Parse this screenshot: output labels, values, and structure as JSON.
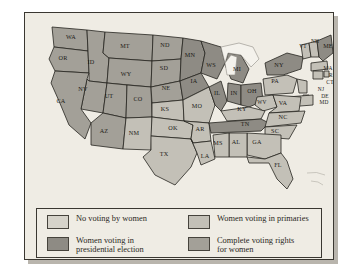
{
  "figure": {
    "colors": {
      "no_voting": "#d6d3ca",
      "primaries": "#c3c0b7",
      "presidential": "#8e8b84",
      "complete": "#a3a098",
      "border": "#26241f",
      "plate_background": "#efece4"
    }
  },
  "legend": {
    "items": [
      {
        "key": "no_voting",
        "swatch_class": "sw-none",
        "label": "No voting by women"
      },
      {
        "key": "presidential",
        "swatch_class": "sw-pres",
        "label": "Women voting in\npresidential election"
      },
      {
        "key": "primaries",
        "swatch_class": "sw-prim",
        "label": "Women voting in primaries"
      },
      {
        "key": "complete",
        "swatch_class": "sw-full",
        "label": "Complete voting rights\nfor women"
      }
    ]
  },
  "map": {
    "states": [
      {
        "abbr": "WA",
        "category": "complete",
        "x": 46,
        "y": 26
      },
      {
        "abbr": "OR",
        "category": "complete",
        "x": 38,
        "y": 47
      },
      {
        "abbr": "ID",
        "category": "complete",
        "x": 66,
        "y": 51
      },
      {
        "abbr": "MT",
        "category": "complete",
        "x": 100,
        "y": 35
      },
      {
        "abbr": "ND",
        "category": "complete",
        "x": 140,
        "y": 34
      },
      {
        "abbr": "MN",
        "category": "presidential",
        "x": 165,
        "y": 44
      },
      {
        "abbr": "WS",
        "category": "presidential",
        "x": 186,
        "y": 54
      },
      {
        "abbr": "SD",
        "category": "complete",
        "x": 139,
        "y": 57
      },
      {
        "abbr": "WY",
        "category": "complete",
        "x": 101,
        "y": 63
      },
      {
        "abbr": "NV",
        "category": "complete",
        "x": 58,
        "y": 78
      },
      {
        "abbr": "CA",
        "category": "complete",
        "x": 36,
        "y": 90
      },
      {
        "abbr": "UT",
        "category": "complete",
        "x": 84,
        "y": 85
      },
      {
        "abbr": "CO",
        "category": "complete",
        "x": 113,
        "y": 88
      },
      {
        "abbr": "NE",
        "category": "complete",
        "x": 141,
        "y": 77
      },
      {
        "abbr": "IA",
        "category": "presidential",
        "x": 169,
        "y": 70
      },
      {
        "abbr": "IL",
        "category": "presidential",
        "x": 192,
        "y": 82
      },
      {
        "abbr": "MI",
        "category": "presidential",
        "x": 212,
        "y": 58
      },
      {
        "abbr": "IN",
        "category": "presidential",
        "x": 209,
        "y": 82
      },
      {
        "abbr": "OH",
        "category": "presidential",
        "x": 227,
        "y": 80
      },
      {
        "abbr": "PA",
        "category": "primaries",
        "x": 250,
        "y": 70
      },
      {
        "abbr": "NY",
        "category": "presidential",
        "x": 254,
        "y": 54
      },
      {
        "abbr": "VT",
        "category": "primaries",
        "x": 278,
        "y": 35
      },
      {
        "abbr": "NH",
        "category": "primaries",
        "x": 290,
        "y": 30
      },
      {
        "abbr": "ME",
        "category": "presidential",
        "x": 303,
        "y": 35
      },
      {
        "abbr": "MA",
        "category": "primaries",
        "x": 303,
        "y": 57
      },
      {
        "abbr": "RI",
        "category": "primaries",
        "x": 307,
        "y": 64
      },
      {
        "abbr": "CT",
        "category": "primaries",
        "x": 305,
        "y": 71
      },
      {
        "abbr": "NJ",
        "category": "primaries",
        "x": 296,
        "y": 78
      },
      {
        "abbr": "DE",
        "category": "primaries",
        "x": 300,
        "y": 85
      },
      {
        "abbr": "MD",
        "category": "primaries",
        "x": 299,
        "y": 91
      },
      {
        "abbr": "WV",
        "category": "primaries",
        "x": 237,
        "y": 91
      },
      {
        "abbr": "VA",
        "category": "primaries",
        "x": 258,
        "y": 92
      },
      {
        "abbr": "KY",
        "category": "primaries",
        "x": 217,
        "y": 98
      },
      {
        "abbr": "MO",
        "category": "primaries",
        "x": 172,
        "y": 95
      },
      {
        "abbr": "KS",
        "category": "primaries",
        "x": 140,
        "y": 98
      },
      {
        "abbr": "OK",
        "category": "primaries",
        "x": 148,
        "y": 117
      },
      {
        "abbr": "AR",
        "category": "primaries",
        "x": 175,
        "y": 118
      },
      {
        "abbr": "TN",
        "category": "presidential",
        "x": 220,
        "y": 113
      },
      {
        "abbr": "NC",
        "category": "primaries",
        "x": 258,
        "y": 106
      },
      {
        "abbr": "SC",
        "category": "primaries",
        "x": 250,
        "y": 120
      },
      {
        "abbr": "GA",
        "category": "primaries",
        "x": 232,
        "y": 131
      },
      {
        "abbr": "AL",
        "category": "primaries",
        "x": 211,
        "y": 131
      },
      {
        "abbr": "MS",
        "category": "primaries",
        "x": 193,
        "y": 132
      },
      {
        "abbr": "LA",
        "category": "primaries",
        "x": 180,
        "y": 145
      },
      {
        "abbr": "TX",
        "category": "primaries",
        "x": 139,
        "y": 143
      },
      {
        "abbr": "NM",
        "category": "primaries",
        "x": 109,
        "y": 122
      },
      {
        "abbr": "AZ",
        "category": "complete",
        "x": 79,
        "y": 120
      },
      {
        "abbr": "FL",
        "category": "primaries",
        "x": 253,
        "y": 154
      }
    ]
  }
}
